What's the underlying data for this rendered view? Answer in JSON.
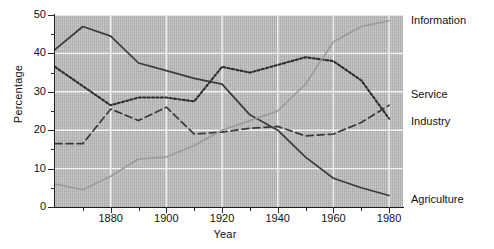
{
  "chart_data": {
    "type": "line",
    "title": "",
    "xlabel": "Year",
    "ylabel": "Percentage",
    "xlim": [
      1860,
      1985
    ],
    "ylim": [
      0,
      50
    ],
    "grid": true,
    "legend_position": "right-inline",
    "xticks": [
      "1880",
      "1900",
      "1920",
      "1940",
      "1960",
      "1980"
    ],
    "xtick_values": [
      1880,
      1900,
      1920,
      1940,
      1960,
      1980
    ],
    "yticks": [
      "0",
      "10",
      "20",
      "30",
      "40",
      "50"
    ],
    "ytick_values": [
      0,
      10,
      20,
      30,
      40,
      50
    ],
    "x": [
      1860,
      1870,
      1880,
      1890,
      1900,
      1910,
      1920,
      1930,
      1940,
      1950,
      1960,
      1970,
      1980
    ],
    "series": [
      {
        "name": "Agriculture",
        "style": "solid",
        "color": "#3b3b3b",
        "values": [
          41,
          47,
          44.5,
          37.5,
          35.5,
          33.5,
          32,
          24,
          20,
          13,
          7.5,
          5,
          3
        ]
      },
      {
        "name": "Service",
        "style": "dotted",
        "color": "#2e2e2e",
        "values": [
          36.5,
          31.5,
          26.5,
          28.5,
          28.5,
          27.5,
          36.5,
          35,
          37,
          39,
          38,
          33,
          23
        ]
      },
      {
        "name": "Industry",
        "style": "dashed",
        "color": "#3a3a3a",
        "values": [
          16.5,
          16.5,
          25.5,
          22.5,
          26,
          19,
          19.5,
          20.5,
          21,
          18.5,
          19,
          22,
          26.5
        ]
      },
      {
        "name": "Information",
        "style": "solid-light",
        "color": "#9b9b9b",
        "values": [
          6,
          4.5,
          8,
          12.5,
          13,
          16,
          20,
          22.5,
          25,
          32,
          43,
          47,
          48.5
        ]
      }
    ]
  },
  "axes": {
    "ylabel": "Percentage",
    "xlabel": "Year"
  },
  "legend": [
    {
      "label": "Information",
      "top": 14
    },
    {
      "label": "Service",
      "top": 88
    },
    {
      "label": "Industry",
      "top": 115
    },
    {
      "label": "Agriculture",
      "top": 193
    }
  ]
}
